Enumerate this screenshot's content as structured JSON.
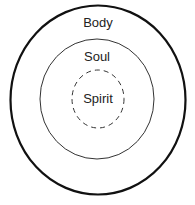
{
  "diagram": {
    "type": "nested-circles",
    "layers": [
      {
        "label": "Body",
        "line_style": "solid-thick"
      },
      {
        "label": "Soul",
        "line_style": "solid-thin"
      },
      {
        "label": "Spirit",
        "line_style": "dashed"
      }
    ],
    "colors": {
      "stroke": "#111111",
      "inner_stroke": "#333333",
      "text": "#222222",
      "background": "#ffffff"
    }
  }
}
